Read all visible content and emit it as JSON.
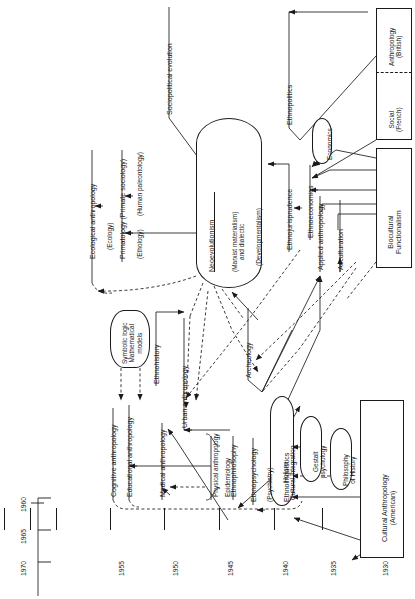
{
  "figure": {
    "kind": "timeline-diagram",
    "title_visible": false,
    "orientation": "rotated-90-ccw",
    "background": "#ffffff",
    "line_color": "#1a1a1a"
  },
  "timeline": {
    "axis_name": "year-axis",
    "years": [
      "1970",
      "1965",
      "1960",
      "1955",
      "1950",
      "1945",
      "1940",
      "1935",
      "1930"
    ]
  },
  "nodes": {
    "sociopolitical_evolution": "Sociopolitical evolution",
    "ecological_anthropology": "Ecological anthropology",
    "ecology": "(Ecology)",
    "primatology": "Primatology (Primate sociology)",
    "ethology": "(Ethology)",
    "human_paleontology": "(Human paleontology)",
    "neoevolutionism": "Neoevolutionism",
    "marxist": "(Marxist materialism)\nand dialectic",
    "marxist_l1": "(Marxist materialism)",
    "marxist_l2": "and dialectic",
    "developmentalism": "(Developmentalism)",
    "ethnopolitics": "Ethnopolitics",
    "economics": "Economics",
    "social_anthropology_title": "Social",
    "social_anthropology_sub": "(French)",
    "british_anthropology_title": "Anthropology",
    "british_anthropology_sub": "(British)",
    "ethnojurisprudence": "Ethnojurisprudence",
    "ethnoeconomics": "Ethnoeconomics",
    "applied_anthropology": "Applied anthropology",
    "acculturation": "Acculturation",
    "biocultural_l1": "Biocultural",
    "biocultural_l2": "Functionalism",
    "symbolic_logic_l1": "Symbolic logic",
    "symbolic_logic_l2": "Mathematical",
    "symbolic_logic_l3": "models",
    "ethnohistory": "Ethnohistory",
    "urban_anthropology": "Urban anthropology",
    "archeology": "Archeology",
    "cognitive_anthropology": "Cognitive anthropology",
    "educational_anthropology": "Educational anthropology",
    "medical_anthropology": "Medical anthropology",
    "physical_anthropology": "Physical anthropology",
    "epidemiology": "Epidemiology",
    "ethnophilosophy": "Ethnophilosophy",
    "ethnopsychology": "Ethnopsychology",
    "psychiatry": "(Psychiatry)",
    "ethnolinguistics": "Ethnolinguistics",
    "holism_l1": "Holism",
    "holism_l2": "Cultural integration",
    "gestalt_l1": "Gestalt",
    "gestalt_l2": "psychology",
    "philosophy_history_l1": "Philosophy",
    "philosophy_history_l2": "of History",
    "cultural_anthropology_l1": "Cultural Anthropology",
    "cultural_anthropology_l2": "(American)"
  }
}
